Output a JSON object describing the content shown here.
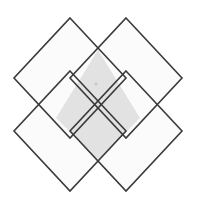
{
  "figure": {
    "canvas": {
      "width": 197,
      "height": 208,
      "background_color": "#ffffff"
    },
    "style": {
      "stroke_color": "#3a3a3a",
      "stroke_width": 1.6,
      "lobe_fill_color": "#fbfbfb",
      "center_fill_color": "#e2e2e2",
      "marker_color": "#c8c8c8"
    },
    "shapes": [
      {
        "name": "top-left-diamond",
        "label": "Top Left Square",
        "fill": "#fbfbfb",
        "center": [
          70,
          78
        ],
        "points": "70,18 126,78 70,138 14,78"
      },
      {
        "name": "top-right-diamond",
        "label": "Top Right Square",
        "fill": "#fbfbfb",
        "center": [
          126,
          78
        ],
        "points": "126,18 182,78 126,138 70,78"
      },
      {
        "name": "bottom-left-diamond",
        "label": "Bottom Left Square",
        "fill": "#fbfbfb",
        "center": [
          70,
          131
        ],
        "points": "70,71 126,131 70,191 14,131"
      },
      {
        "name": "bottom-right-diamond",
        "label": "Bottom Right Square",
        "fill": "#fbfbfb",
        "center": [
          126,
          131
        ],
        "points": "126,71 182,131 126,191 70,131"
      }
    ],
    "center_region": {
      "name": "central-overlap-region",
      "label": "Central Overlap",
      "fill": "#e2e2e2",
      "points": "98,50 140,118 98,160 56,118"
    },
    "marker": {
      "name": "center-point-marker",
      "label": "Center Point",
      "x": 96,
      "y": 84,
      "radius": 1.6,
      "color": "#c6c6c6"
    },
    "vertices": {
      "top_left_apex": [
        70,
        18
      ],
      "top_right_apex": [
        126,
        18
      ],
      "left_apex": [
        14,
        78
      ],
      "right_apex": [
        182,
        131
      ],
      "bottom_left_apex": [
        70,
        191
      ],
      "bottom_right_apex": [
        126,
        191
      ],
      "crossing_top": [
        98,
        50
      ],
      "crossing_right": [
        140,
        118
      ],
      "crossing_bottom": [
        98,
        160
      ],
      "crossing_left": [
        56,
        118
      ]
    }
  }
}
